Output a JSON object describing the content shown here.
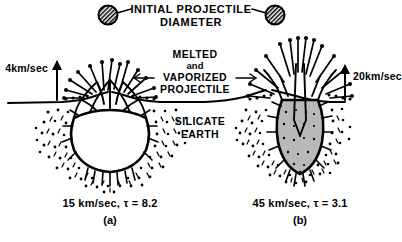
{
  "figure": {
    "background_color": "#ffffff",
    "ink_color": "#000000",
    "melt_fill_color": "#b8b8b8",
    "cavity_fill_color": "#ffffff"
  },
  "annotations": {
    "title_line1": "INITIAL PROJECTILE",
    "title_line2": "DIAMETER",
    "melt_line1": "MELTED",
    "melt_line2": "and",
    "melt_line3": "VAPORIZED",
    "melt_line4": "PROJECTILE",
    "target_line1": "SILICATE",
    "target_line2": "EARTH",
    "velocity_left": "4km/sec",
    "velocity_right": "20km/sec"
  },
  "panels": [
    {
      "id": "a",
      "caption": "15 km/sec, τ = 8.2",
      "panel_label": "(a)",
      "impact_velocity": "15 km/sec",
      "tau": "8.2",
      "ejecta_velocity": "4km/sec",
      "crater_shape": "wide-hemispherical-open-cavity"
    },
    {
      "id": "b",
      "caption": "45 km/sec, τ = 3.1",
      "panel_label": "(b)",
      "impact_velocity": "45 km/sec",
      "tau": "3.1",
      "ejecta_velocity": "20km/sec",
      "crater_shape": "narrow-deep-teardrop-melt-filled"
    }
  ],
  "icons": {
    "projectile_left": "hatched-circle-icon",
    "projectile_right": "hatched-circle-icon",
    "arrow_up_left": "arrow-up-icon",
    "arrow_up_right": "arrow-up-icon",
    "leader_left": "leader-line-icon",
    "leader_right": "leader-line-icon",
    "melt_arrow_left": "arrow-left-icon",
    "melt_arrow_right": "arrow-right-icon"
  }
}
